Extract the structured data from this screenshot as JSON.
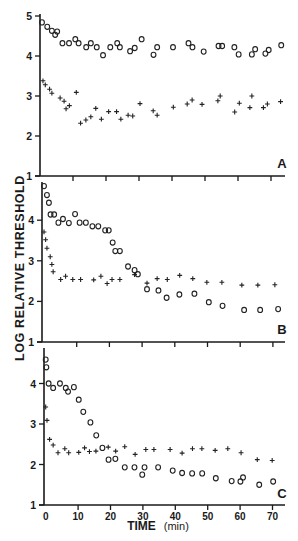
{
  "chart_data": [
    {
      "type": "scatter",
      "panel": "A",
      "xlabel": "TIME (min)",
      "ylabel": "LOG RELATIVE THRESHOLD",
      "xlim": [
        0,
        75
      ],
      "ylim": [
        1,
        5
      ],
      "yticks": [
        1,
        2,
        3,
        4,
        5
      ],
      "xticks": [
        0,
        10,
        20,
        30,
        40,
        50,
        60,
        70
      ],
      "grid": false,
      "series": [
        {
          "name": "circles",
          "marker": "o",
          "x": [
            0.6,
            2.2,
            3.6,
            4.6,
            5.2,
            6.8,
            8.8,
            10.7,
            11.7,
            14,
            15.4,
            17.2,
            19.1,
            21.3,
            23.4,
            24.2,
            27.3,
            28.7,
            30.8,
            34.4,
            35.5,
            40.3,
            45,
            46.2,
            49.6,
            54.1,
            55.2,
            58.9,
            60.2,
            64.2,
            65.2,
            68.3,
            69.3,
            73.1
          ],
          "y": [
            4.84,
            4.73,
            4.63,
            4.53,
            4.61,
            4.32,
            4.32,
            4.42,
            4.32,
            4.22,
            4.32,
            4.22,
            4.02,
            4.22,
            4.32,
            4.22,
            4.12,
            4.2,
            4.42,
            4.03,
            4.22,
            4.22,
            4.32,
            4.22,
            4.11,
            4.25,
            4.25,
            4.22,
            4.04,
            4.04,
            4.17,
            4.06,
            4.15,
            4.27
          ]
        },
        {
          "name": "crosses",
          "marker": "+",
          "x": [
            0.9,
            1.6,
            2.9,
            3.6,
            6.1,
            7.3,
            7.9,
            8.9,
            11,
            12.3,
            13.9,
            15.4,
            16.9,
            18.6,
            20.8,
            23.2,
            24.5,
            26.7,
            28.1,
            30.3,
            34.3,
            35.5,
            40.4,
            44.6,
            46.1,
            49.1,
            53.9,
            54.6,
            59,
            60.4,
            63.6,
            64.2,
            67.7,
            68.9,
            72.9
          ],
          "y": [
            3.38,
            3.28,
            3.17,
            3.07,
            2.95,
            2.87,
            2.68,
            2.76,
            3.09,
            2.32,
            2.4,
            2.48,
            2.69,
            2.42,
            2.61,
            2.61,
            2.42,
            2.52,
            2.5,
            2.81,
            2.63,
            2.52,
            2.72,
            2.8,
            2.9,
            2.79,
            2.88,
            3.0,
            2.6,
            2.82,
            2.71,
            3.0,
            2.71,
            2.8,
            2.86
          ]
        }
      ]
    },
    {
      "type": "scatter",
      "panel": "B",
      "xlabel": "TIME (min)",
      "ylabel": "LOG RELATIVE THRESHOLD",
      "xlim": [
        0,
        75
      ],
      "ylim": [
        1,
        4.9
      ],
      "yticks": [
        1,
        2,
        3,
        4
      ],
      "xticks": [
        0,
        10,
        20,
        30,
        40,
        50,
        60,
        70
      ],
      "grid": false,
      "series": [
        {
          "name": "circles",
          "marker": "o",
          "x": [
            0,
            0.9,
            1.5,
            2,
            3.1,
            4.4,
            5.8,
            7.6,
            9.5,
            10.9,
            12.8,
            14.8,
            16.6,
            18.7,
            19.8,
            21,
            21.8,
            23.2,
            25.7,
            27.7,
            28.7,
            31.5,
            35,
            37.5,
            41.4,
            46,
            50.4,
            54.6,
            61.2,
            66.1,
            71.6
          ],
          "y": [
            4.84,
            4.62,
            4.43,
            4.14,
            4.14,
            3.94,
            4.03,
            3.93,
            4.15,
            3.94,
            3.94,
            3.85,
            3.85,
            3.75,
            3.75,
            3.45,
            3.24,
            3.24,
            2.86,
            2.77,
            2.67,
            2.3,
            2.27,
            2.09,
            2.17,
            2.19,
            1.98,
            1.89,
            1.79,
            1.79,
            1.81
          ]
        },
        {
          "name": "crosses",
          "marker": "+",
          "x": [
            0,
            0.5,
            0.9,
            1.9,
            2.4,
            2.8,
            5.1,
            6.6,
            8.8,
            11.2,
            15.2,
            17.4,
            19.3,
            20.8,
            23.2,
            27.7,
            31.5,
            34.6,
            37.7,
            41.5,
            45.5,
            49.8,
            54.4,
            60.5,
            65.4,
            70.6
          ],
          "y": [
            3.71,
            3.52,
            3.31,
            3.1,
            2.91,
            2.73,
            2.54,
            2.62,
            2.54,
            2.54,
            2.53,
            2.62,
            2.44,
            2.54,
            2.54,
            2.66,
            2.45,
            2.56,
            2.54,
            2.64,
            2.56,
            2.47,
            2.47,
            2.4,
            2.4,
            2.41
          ]
        }
      ]
    },
    {
      "type": "scatter",
      "panel": "C",
      "xlabel": "TIME (min)",
      "ylabel": "LOG RELATIVE THRESHOLD",
      "xlim": [
        0,
        75
      ],
      "ylim": [
        1,
        4.8
      ],
      "yticks": [
        1,
        2,
        3,
        4
      ],
      "xticks": [
        0,
        10,
        20,
        30,
        40,
        50,
        60,
        70
      ],
      "grid": false,
      "series": [
        {
          "name": "circles",
          "marker": "o",
          "x": [
            0,
            0.2,
            0.9,
            2.3,
            4.4,
            6.2,
            6.9,
            8.7,
            10.2,
            11.6,
            13.8,
            15.6,
            17.5,
            19.4,
            21.5,
            24.4,
            27.4,
            29.8,
            30.5,
            34.7,
            39.2,
            42.1,
            45.2,
            48.3,
            52.5,
            57.4,
            60.1,
            60.9,
            65.9,
            70.2
          ],
          "y": [
            4.59,
            4.4,
            4.0,
            3.89,
            4.0,
            3.89,
            3.8,
            3.91,
            3.6,
            3.3,
            3.04,
            2.72,
            2.41,
            2.12,
            2.14,
            1.93,
            1.93,
            1.75,
            1.93,
            1.93,
            1.85,
            1.79,
            1.78,
            1.78,
            1.66,
            1.59,
            1.58,
            1.68,
            1.5,
            1.58
          ]
        },
        {
          "name": "crosses",
          "marker": "+",
          "x": [
            0,
            0.4,
            1.2,
            2.3,
            3.8,
            5.9,
            7.1,
            10.2,
            12,
            13.5,
            15.5,
            19.3,
            21.6,
            24.4,
            27.6,
            30.9,
            33.4,
            38.4,
            42.1,
            45.3,
            48.2,
            52.3,
            56.2,
            60.3,
            65.3,
            69.9
          ],
          "y": [
            3.42,
            3.09,
            2.62,
            2.48,
            2.29,
            2.39,
            2.29,
            2.3,
            2.41,
            2.32,
            2.33,
            2.43,
            2.33,
            2.44,
            2.25,
            2.37,
            2.37,
            2.37,
            2.28,
            2.39,
            2.39,
            2.35,
            2.39,
            2.29,
            2.12,
            2.1
          ]
        }
      ]
    }
  ],
  "figure": {
    "ylabel": "LOG RELATIVE THRESHOLD",
    "xlabel": "TIME (min)",
    "panel_labels": [
      "A",
      "B",
      "C"
    ],
    "x_tick_labels": [
      "0",
      "10",
      "20",
      "30",
      "40",
      "50",
      "60",
      "70"
    ],
    "panel_y_tick_labels": [
      [
        "1",
        "2",
        "3",
        "4",
        "5"
      ],
      [
        "1",
        "2",
        "3",
        "4"
      ],
      [
        "1",
        "2",
        "3",
        "4"
      ]
    ]
  }
}
